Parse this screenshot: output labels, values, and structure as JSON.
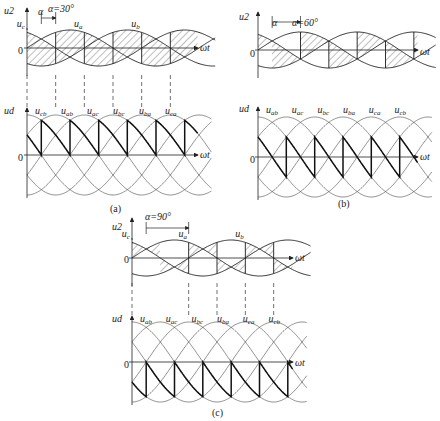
{
  "figure": {
    "panels": [
      {
        "id": "a",
        "caption": "(a)",
        "alpha_label": "α",
        "alpha_value_label": "α=30°",
        "alpha_deg": 30,
        "top_axis_label": "u2",
        "bottom_axis_label": "ud",
        "x_axis_label": "ωt",
        "zero_label": "0",
        "phase_labels": [
          "ua",
          "ub",
          "uc"
        ],
        "line_labels": [
          "ucb",
          "uab",
          "uac",
          "ubc",
          "uba",
          "uca"
        ]
      },
      {
        "id": "b",
        "caption": "(b)",
        "alpha_label": "α",
        "alpha_value_label": "α=60°",
        "alpha_deg": 60,
        "top_axis_label": "u2",
        "bottom_axis_label": "ud",
        "x_axis_label": "ωt",
        "zero_label": "0",
        "phase_labels": [],
        "line_labels": [
          "uab",
          "uac",
          "ubc",
          "uba",
          "uca",
          "ucb"
        ]
      },
      {
        "id": "c",
        "caption": "(c)",
        "alpha_label": "",
        "alpha_value_label": "α=90°",
        "alpha_deg": 90,
        "top_axis_label": "u2",
        "bottom_axis_label": "ud",
        "x_axis_label": "ωt",
        "zero_label": "0",
        "phase_labels": [
          "ua",
          "ub",
          "uc"
        ],
        "line_labels": [
          "uab",
          "uac",
          "ubc",
          "uba",
          "uca",
          "ucb"
        ]
      }
    ],
    "colors": {
      "line": "#1a1a1a",
      "thin": "#333333",
      "hatch": "#444444",
      "background": "#ffffff"
    }
  }
}
